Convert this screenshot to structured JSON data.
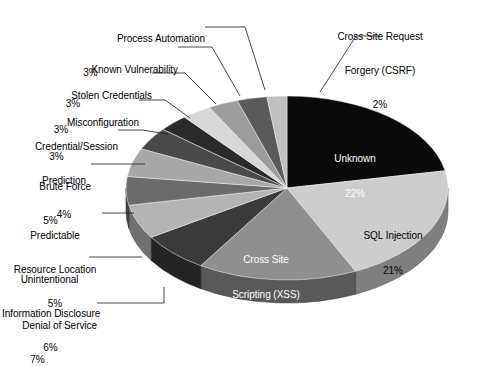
{
  "chart_data": {
    "type": "pie",
    "title": "",
    "subtitle": "",
    "xlabel": "",
    "ylabel": "",
    "legend_position": "none",
    "grid": false,
    "units": "percent",
    "style": "3d-exploded-none",
    "start_angle_deg": 0,
    "direction": "clockwise",
    "categories": [
      "Unknown",
      "SQL Injection",
      "Cross Site Scripting (XSS)",
      "Denial of Service",
      "Unintentional Information Disclosure",
      "Predictable Resource Location",
      "Brute Force",
      "Credential/Session Prediction",
      "Misconfiguration",
      "Stolen Credentials",
      "Known Vulnerability",
      "Process Automation",
      "Cross Site Request Forgery (CSRF)"
    ],
    "values": [
      22,
      21,
      16,
      7,
      6,
      5,
      5,
      4,
      3,
      3,
      3,
      3,
      2
    ],
    "value_labels": [
      "22%",
      "21%",
      "16%",
      "7%",
      "6%",
      "5%",
      "5%",
      "4%",
      "3%",
      "3%",
      "3%",
      "3%",
      "2%"
    ],
    "colors": [
      "#0a0a0a",
      "#cdcdcd",
      "#8f8f8f",
      "#3a3a3a",
      "#b4b4b4",
      "#6b6b6b",
      "#a8a8a8",
      "#4a4a4a",
      "#2a2a2a",
      "#d8d8d8",
      "#9c9c9c",
      "#5a5a5a",
      "#c0c0c0"
    ],
    "slices": [
      {
        "name": "Unknown",
        "value": 22,
        "label": "Unknown",
        "value_label": "22%",
        "color": "#0a0a0a",
        "placement": "inside",
        "text_color": "#ffffff"
      },
      {
        "name": "SQL Injection",
        "value": 21,
        "label": "SQL Injection",
        "value_label": "21%",
        "color": "#cdcdcd",
        "placement": "inside",
        "text_color": "#000000"
      },
      {
        "name": "Cross Site Scripting (XSS)",
        "value": 16,
        "label": "Cross Site\nScripting (XSS)",
        "value_label": "16%",
        "color": "#8f8f8f",
        "placement": "inside",
        "text_color": "#ffffff"
      },
      {
        "name": "Denial of Service",
        "value": 7,
        "label": "Denial of Service",
        "value_label": "7%",
        "color": "#3a3a3a",
        "placement": "outside",
        "text_color": "#000000"
      },
      {
        "name": "Unintentional Information Disclosure",
        "value": 6,
        "label": "Unintentional\nInformation Disclosure",
        "value_label": "6%",
        "color": "#b4b4b4",
        "placement": "outside",
        "text_color": "#000000"
      },
      {
        "name": "Predictable Resource Location",
        "value": 5,
        "label": "Predictable\nResource Location",
        "value_label": "5%",
        "color": "#6b6b6b",
        "placement": "outside",
        "text_color": "#000000"
      },
      {
        "name": "Brute Force",
        "value": 5,
        "label": "Brute Force",
        "value_label": "5%",
        "color": "#a8a8a8",
        "placement": "outside",
        "text_color": "#000000"
      },
      {
        "name": "Credential/Session Prediction",
        "value": 4,
        "label": "Credential/Session\nPrediction",
        "value_label": "4%",
        "color": "#4a4a4a",
        "placement": "outside",
        "text_color": "#000000"
      },
      {
        "name": "Misconfiguration",
        "value": 3,
        "label": "Misconfiguration",
        "value_label": "3%",
        "color": "#2a2a2a",
        "placement": "outside",
        "text_color": "#000000"
      },
      {
        "name": "Stolen Credentials",
        "value": 3,
        "label": "Stolen Credentials",
        "value_label": "3%",
        "color": "#d8d8d8",
        "placement": "outside",
        "text_color": "#000000"
      },
      {
        "name": "Known Vulnerability",
        "value": 3,
        "label": "Known Vulnerability",
        "value_label": "3%",
        "color": "#9c9c9c",
        "placement": "outside",
        "text_color": "#000000"
      },
      {
        "name": "Process Automation",
        "value": 3,
        "label": "Process Automation",
        "value_label": "3%",
        "color": "#5a5a5a",
        "placement": "outside",
        "text_color": "#000000"
      },
      {
        "name": "Cross Site Request Forgery (CSRF)",
        "value": 2,
        "label": "Cross Site Request\nForgery (CSRF)",
        "value_label": "2%",
        "color": "#c0c0c0",
        "placement": "outside",
        "text_color": "#000000"
      }
    ]
  },
  "inside_labels": {
    "unknown": {
      "name": "Unknown",
      "value_label": "22%"
    },
    "sql": {
      "name": "SQL Injection",
      "value_label": "21%"
    },
    "xss_l1": {
      "text": "Cross Site"
    },
    "xss_l2": {
      "text": "Scripting (XSS)"
    },
    "xss_val": {
      "value_label": "16%"
    }
  },
  "outside_labels": {
    "csrf_l1": {
      "text": "Cross Site Request"
    },
    "csrf_l2": {
      "text": "Forgery (CSRF)"
    },
    "csrf_val": {
      "text": "2%"
    },
    "procauto_l1": {
      "text": "Process Automation"
    },
    "procauto_val": {
      "text": "3%"
    },
    "knownvuln_l1": {
      "text": "Known Vulnerability"
    },
    "knownvuln_val": {
      "text": "3%"
    },
    "stolencred_l1": {
      "text": "Stolen Credentials"
    },
    "stolencred_val": {
      "text": "3%"
    },
    "misconfig_l1": {
      "text": "Misconfiguration"
    },
    "misconfig_val": {
      "text": "3%"
    },
    "credsess_l1": {
      "text": "Credential/Session"
    },
    "credsess_l2": {
      "text": "Prediction"
    },
    "credsess_val": {
      "text": "4%"
    },
    "bruteforce_l1": {
      "text": "Brute Force"
    },
    "bruteforce_val": {
      "text": "5%"
    },
    "predres_l1": {
      "text": "Predictable"
    },
    "predres_l2": {
      "text": "Resource Location"
    },
    "predres_val": {
      "text": "5%"
    },
    "uninfo_l1": {
      "text": "Unintentional"
    },
    "uninfo_l2": {
      "text": "Information Disclosure"
    },
    "uninfo_val": {
      "text": "6%"
    },
    "dos_l1": {
      "text": "Denial of Service"
    },
    "dos_val": {
      "text": "7%"
    }
  }
}
